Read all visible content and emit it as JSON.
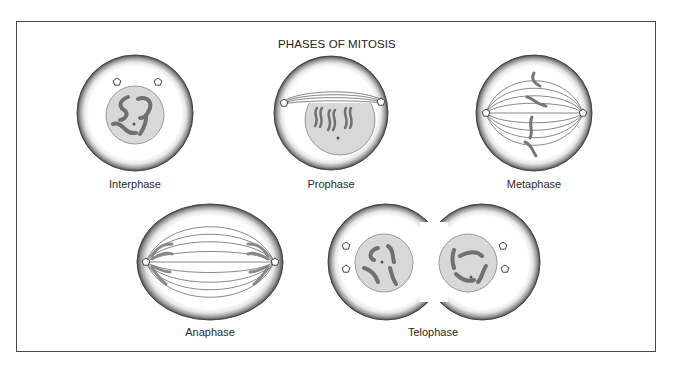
{
  "title": "PHASES OF MITOSIS",
  "phases": [
    {
      "name": "Interphase",
      "label_x": 135,
      "label_y": 178
    },
    {
      "name": "Prophase",
      "label_x": 331,
      "label_y": 178
    },
    {
      "name": "Metaphase",
      "label_x": 534,
      "label_y": 178
    },
    {
      "name": "Anaphase",
      "label_x": 210,
      "label_y": 326
    },
    {
      "name": "Telophase",
      "label_x": 433,
      "label_y": 326
    }
  ],
  "colors": {
    "membrane": "#5a5a5a",
    "nucleus_fill": "#d8d8d8",
    "chromosome": "#707070",
    "spindle": "#6a6a6a",
    "frame": "#4a4a4a"
  }
}
